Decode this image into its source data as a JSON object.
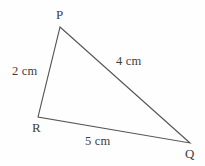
{
  "figure": {
    "type": "triangle-diagram",
    "background_color": "#fefefe",
    "stroke_color": "#555555",
    "text_color": "#3d3d3d",
    "stroke_width": 1.1,
    "canvas": {
      "width": 205,
      "height": 166
    },
    "vertices": [
      {
        "id": "P",
        "label": "P",
        "x": 60,
        "y": 27,
        "label_x": 56,
        "label_y": 8
      },
      {
        "id": "R",
        "label": "R",
        "x": 38,
        "y": 117,
        "label_x": 32,
        "label_y": 121
      },
      {
        "id": "Q",
        "label": "Q",
        "x": 190,
        "y": 143,
        "label_x": 185,
        "label_y": 147
      }
    ],
    "sides": [
      {
        "id": "PR",
        "from": "P",
        "to": "R",
        "label": "2 cm",
        "length_value": 2,
        "unit": "cm",
        "label_x": 12,
        "label_y": 65
      },
      {
        "id": "PQ",
        "from": "P",
        "to": "Q",
        "label": "4 cm",
        "length_value": 4,
        "unit": "cm",
        "label_x": 116,
        "label_y": 55
      },
      {
        "id": "RQ",
        "from": "R",
        "to": "Q",
        "label": "5 cm",
        "length_value": 5,
        "unit": "cm",
        "label_x": 85,
        "label_y": 135
      }
    ]
  },
  "chart_data": {
    "type": "diagram",
    "shape": "triangle",
    "points": [
      {
        "name": "P",
        "x": 60,
        "y": 27
      },
      {
        "name": "Q",
        "x": 190,
        "y": 143
      },
      {
        "name": "R",
        "x": 38,
        "y": 117
      }
    ],
    "edges": [
      {
        "from": "P",
        "to": "R",
        "label": "2 cm",
        "value": 2,
        "unit": "cm"
      },
      {
        "from": "P",
        "to": "Q",
        "label": "4 cm",
        "value": 4,
        "unit": "cm"
      },
      {
        "from": "R",
        "to": "Q",
        "label": "5 cm",
        "value": 5,
        "unit": "cm"
      }
    ],
    "xlabel": "",
    "ylabel": "",
    "grid": false,
    "legend": false
  }
}
